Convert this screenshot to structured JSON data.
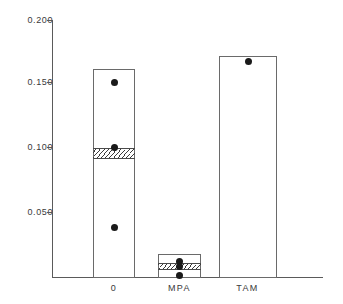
{
  "chart_data": {
    "type": "bar",
    "title": "",
    "xlabel": "",
    "ylabel": "",
    "categories": [
      "0",
      "MPA",
      "TAM"
    ],
    "values": [
      0.16,
      0.018,
      0.17
    ],
    "ylim": [
      0.0,
      0.2
    ],
    "yticks": [
      0.2,
      0.15,
      0.1,
      0.05
    ],
    "ytick_labels": [
      "0.200",
      "0.150",
      "0.100",
      "0.050"
    ],
    "grid": false,
    "legend": "none",
    "series": [
      {
        "name": "bar-height",
        "values": [
          0.16,
          0.018,
          0.17
        ]
      },
      {
        "name": "hatched-band-low",
        "values": [
          0.092,
          0.006,
          null
        ]
      },
      {
        "name": "hatched-band-high",
        "values": [
          0.1,
          0.011,
          null
        ]
      }
    ],
    "points": [
      {
        "category": "0",
        "values": [
          0.15,
          0.1,
          0.039
        ]
      },
      {
        "category": "MPA",
        "values": [
          0.012,
          0.009,
          0.0
        ]
      },
      {
        "category": "TAM",
        "values": [
          0.166
        ]
      }
    ],
    "annotations": []
  },
  "axis": {
    "ticks": [
      {
        "label": "0.200",
        "top": 20
      },
      {
        "label": "0.150",
        "top": 82
      },
      {
        "label": "0.100",
        "top": 147
      },
      {
        "label": "0.050",
        "top": 212
      }
    ]
  },
  "bars": [
    {
      "label": "0",
      "left": 93,
      "width": 42,
      "top": 69,
      "height": 209,
      "band": {
        "top": 148,
        "height": 11
      },
      "label_left": 93,
      "label_width": 42,
      "dots": [
        {
          "cx": 114,
          "cy": 82
        },
        {
          "cx": 114,
          "cy": 147
        },
        {
          "cx": 114,
          "cy": 227
        }
      ]
    },
    {
      "label": "MPA",
      "left": 158,
      "width": 43,
      "top": 254,
      "height": 24,
      "band": {
        "top": 263,
        "height": 7
      },
      "label_left": 157,
      "label_width": 45,
      "dots": [
        {
          "cx": 179,
          "cy": 261
        },
        {
          "cx": 179,
          "cy": 266
        },
        {
          "cx": 179,
          "cy": 275
        }
      ]
    },
    {
      "label": "TAM",
      "left": 219,
      "width": 58,
      "top": 56,
      "height": 222,
      "band": null,
      "label_left": 225,
      "label_width": 45,
      "dots": [
        {
          "cx": 248,
          "cy": 61
        }
      ]
    }
  ],
  "colors": {
    "axis": "#5a5a5a",
    "bar_border": "#6a6a6a",
    "dot": "#1a1a1a",
    "text": "#3a3a3a",
    "background": "#ffffff"
  }
}
